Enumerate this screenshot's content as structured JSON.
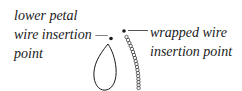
{
  "diagram": {
    "left_label": {
      "line1": "lower petal",
      "line2": "wire insertion —",
      "line3": "point"
    },
    "right_label": {
      "line1": "wrapped wire",
      "line2": "insertion point"
    },
    "shapes": {
      "petal": "teardrop-outline",
      "wrapped_wire": "bead-chain",
      "colors": {
        "stroke": "#1a1a1a",
        "background": "#ffffff"
      }
    }
  }
}
